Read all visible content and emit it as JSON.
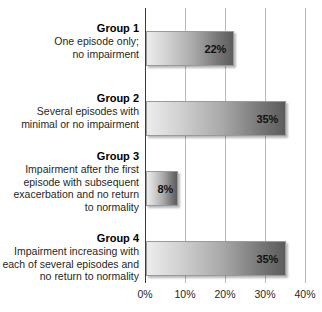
{
  "chart_data": {
    "type": "bar",
    "orientation": "horizontal",
    "title": "",
    "subtitle": "",
    "xlabel": "",
    "ylabel": "",
    "xlim": [
      0,
      40
    ],
    "grid": true,
    "legend": null,
    "categories": [
      "Group 1 — One episode only; no impairment",
      "Group 2 — Several episodes with minimal or no impairment",
      "Group 3 — Impairment after the first episode with subsequent exacerbation and no return to normality",
      "Group 4 — Impairment increasing with each of several episodes and no return to normality"
    ],
    "values": [
      22,
      35,
      8,
      35
    ],
    "value_labels": [
      "22%",
      "35%",
      "8%",
      "35%"
    ],
    "tick_labels": [
      "0%",
      "10%",
      "20%",
      "30%",
      "40%"
    ],
    "tick_values": [
      0,
      10,
      20,
      30,
      40
    ],
    "bars": [
      {
        "title": "Group 1",
        "lines": [
          "One episode only;",
          "no impairment"
        ],
        "value": 22,
        "value_label": "22%"
      },
      {
        "title": "Group 2",
        "lines": [
          "Several episodes with",
          "minimal or no impairment"
        ],
        "value": 35,
        "value_label": "35%"
      },
      {
        "title": "Group 3",
        "lines": [
          "Impairment after the first",
          "episode with subsequent",
          "exacerbation and no return",
          "to normality"
        ],
        "value": 8,
        "value_label": "8%"
      },
      {
        "title": "Group 4",
        "lines": [
          "Impairment increasing with",
          "each of several episodes and",
          "no return to normality"
        ],
        "value": 35,
        "value_label": "35%"
      }
    ],
    "colors": {
      "bar_gradient_start": "#ececec",
      "bar_gradient_end": "#5c5c5c",
      "bar_border": "#9a9a9a",
      "gridline": "#b9b9b9",
      "axis_line": "#3a3a3a",
      "text": "#1f1f1f",
      "background": "#ffffff"
    }
  }
}
